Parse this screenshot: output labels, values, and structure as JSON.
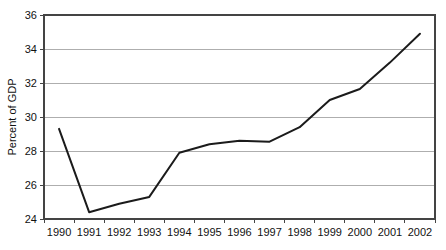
{
  "chart_data": {
    "type": "line",
    "title": "",
    "xlabel": "",
    "ylabel": "Percent of GDP",
    "categories": [
      "1990",
      "1991",
      "1992",
      "1993",
      "1994",
      "1995",
      "1996",
      "1997",
      "1998",
      "1999",
      "2000",
      "2001",
      "2002"
    ],
    "x": [
      1990,
      1991,
      1992,
      1993,
      1994,
      1995,
      1996,
      1997,
      1998,
      1999,
      2000,
      2001,
      2002
    ],
    "values": [
      29.3,
      24.4,
      24.9,
      25.3,
      27.9,
      28.4,
      28.6,
      28.55,
      29.4,
      31.0,
      31.65,
      33.2,
      34.9
    ],
    "series": [
      {
        "name": "Percent of GDP",
        "values": [
          29.3,
          24.4,
          24.9,
          25.3,
          27.9,
          28.4,
          28.6,
          28.55,
          29.4,
          31.0,
          31.65,
          33.2,
          34.9
        ],
        "color": "#1b1b1b"
      }
    ],
    "ylim": [
      24,
      36
    ],
    "yticks": [
      24,
      26,
      28,
      30,
      32,
      34,
      36
    ],
    "ytick_labels": [
      "24",
      "26",
      "28",
      "30",
      "32",
      "34",
      "36"
    ],
    "xtick_labels": [
      "1990",
      "1991",
      "1992",
      "1993",
      "1994",
      "1995",
      "1996",
      "1997",
      "1998",
      "1999",
      "2000",
      "2001",
      "2002"
    ],
    "grid": true,
    "grid_axis": "y",
    "legend": false,
    "legend_position": "none",
    "line_color": "#1b1b1b",
    "grid_color": "#9a9a9a",
    "frame_color": "#444444",
    "background_color": "#ffffff"
  },
  "layout": {
    "plot_left": 44,
    "plot_right": 435,
    "plot_top": 15,
    "plot_bottom": 219
  }
}
